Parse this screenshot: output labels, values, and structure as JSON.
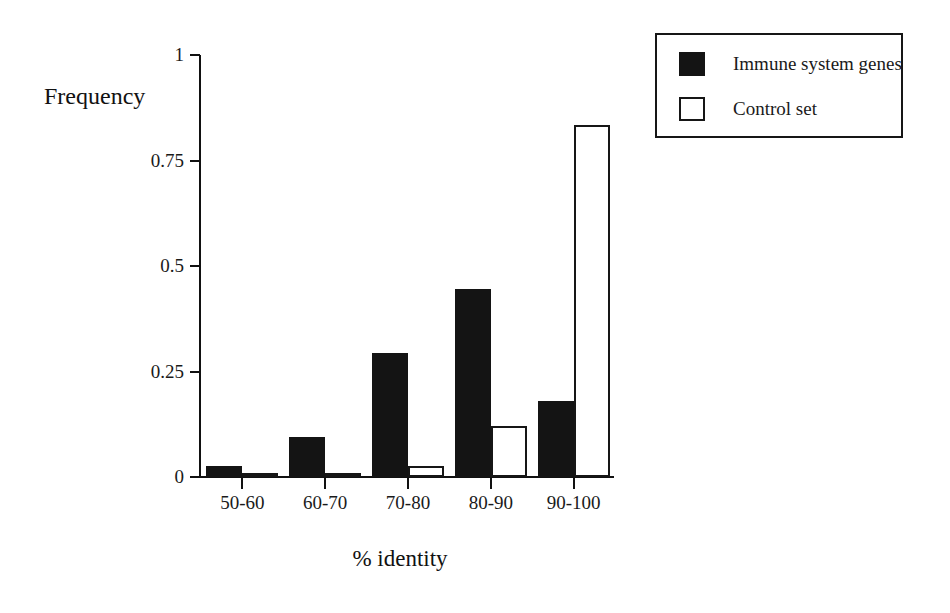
{
  "chart_data": {
    "type": "bar",
    "title": "",
    "xlabel": "% identity",
    "ylabel": "Frequency",
    "categories": [
      "50-60",
      "60-70",
      "70-80",
      "80-90",
      "90-100"
    ],
    "series": [
      {
        "name": "Immune system genes",
        "color": "#141414",
        "style": "filled",
        "values": [
          0.025,
          0.095,
          0.295,
          0.445,
          0.18
        ]
      },
      {
        "name": "Control set",
        "color": "#ffffff",
        "style": "outline",
        "values": [
          0.005,
          0.008,
          0.025,
          0.12,
          0.835
        ]
      }
    ],
    "ylim": [
      0,
      1
    ],
    "yticks": [
      0,
      0.25,
      0.5,
      0.75,
      1
    ],
    "ytick_labels": [
      "0",
      "0.25",
      "0.5",
      "0.75",
      "1"
    ],
    "grid": false,
    "legend_position": "top-right",
    "legend_entries": [
      "Immune system genes",
      "Control set"
    ]
  },
  "axis": {
    "y_title": "Frequency",
    "x_title": "% identity",
    "y_tick_labels": [
      "1",
      "0.75",
      "0.5",
      "0.25",
      "0"
    ],
    "x_tick_labels": [
      "50-60",
      "60-70",
      "70-80",
      "80-90",
      "90-100"
    ]
  },
  "legend": {
    "items": [
      {
        "label": "Immune system genes",
        "swatch": "filled-square-dark"
      },
      {
        "label": "Control set",
        "swatch": "open-square-outline"
      }
    ]
  }
}
